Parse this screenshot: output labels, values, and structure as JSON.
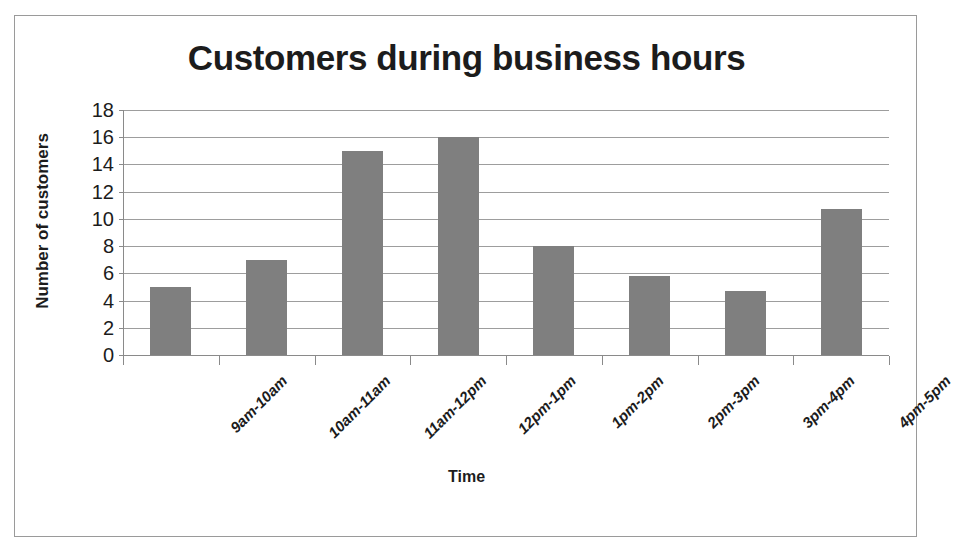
{
  "chart_data": {
    "type": "bar",
    "title": "Customers during business hours",
    "xlabel": "Time",
    "ylabel": "Number of customers",
    "categories": [
      "9am-10am",
      "10am-11am",
      "11am-12pm",
      "12pm-1pm",
      "1pm-2pm",
      "2pm-3pm",
      "3pm-4pm",
      "4pm-5pm"
    ],
    "values": [
      5,
      7,
      15,
      16,
      8,
      5.8,
      4.7,
      10.7
    ],
    "ylim": [
      0,
      18
    ],
    "ytick_labels": [
      "0",
      "2",
      "4",
      "6",
      "8",
      "10",
      "12",
      "14",
      "16",
      "18"
    ],
    "ytick_values": [
      0,
      2,
      4,
      6,
      8,
      10,
      12,
      14,
      16,
      18
    ],
    "grid": "horizontal",
    "legend": "none",
    "bar_color": "#7f7f7f",
    "gridline_color": "#9d9d9d",
    "axis_color": "#8a8a8a",
    "text_color": "#1c1c1c",
    "frame_border_color": "#9a9a9a",
    "background": "#ffffff"
  }
}
